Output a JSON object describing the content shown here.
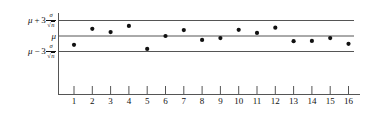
{
  "chart_data": {
    "type": "scatter",
    "title": "",
    "subtitle": "",
    "xlabel": "",
    "ylabel": "",
    "categories": [
      1,
      2,
      3,
      4,
      5,
      6,
      7,
      8,
      9,
      10,
      11,
      12,
      13,
      14,
      15,
      16
    ],
    "xtick_labels": [
      "1",
      "2",
      "3",
      "4",
      "5",
      "6",
      "7",
      "8",
      "9",
      "10",
      "11",
      "12",
      "13",
      "14",
      "15",
      "16"
    ],
    "xlim": [
      0.5,
      16.5
    ],
    "ylim": [
      -4.2,
      4.2
    ],
    "grid": false,
    "legend": "none",
    "series": [
      {
        "name": "sample means",
        "marker": "filled-circle",
        "color": "#111111",
        "x": [
          1,
          2,
          3,
          4,
          5,
          6,
          7,
          8,
          9,
          10,
          11,
          12,
          13,
          14,
          15,
          16
        ],
        "values": [
          -1.7,
          1.4,
          0.75,
          1.95,
          -2.5,
          0.0,
          1.15,
          -0.75,
          -0.4,
          1.2,
          0.6,
          1.6,
          -1.0,
          -0.95,
          -0.4,
          -1.5
        ]
      }
    ],
    "reference_lines": [
      {
        "name": "upper-control-limit",
        "value": 3,
        "label_plain": "mu + 3 sigma / sqrt(n)",
        "label_parts": {
          "mu": "μ",
          "op": "+",
          "coef": "3",
          "num": "σ",
          "den_sym": "√",
          "den_body": "n"
        },
        "color": "#555555"
      },
      {
        "name": "center-line",
        "value": 0,
        "label_plain": "mu",
        "label_parts": {
          "mu": "μ",
          "op": "",
          "coef": "",
          "num": "",
          "den_sym": "",
          "den_body": ""
        },
        "color": "#555555"
      },
      {
        "name": "lower-control-limit",
        "value": -3,
        "label_plain": "mu - 3 sigma / sqrt(n)",
        "label_parts": {
          "mu": "μ",
          "op": "−",
          "coef": "3",
          "num": "σ",
          "den_sym": "√",
          "den_body": "n"
        },
        "color": "#555555"
      }
    ],
    "axis_color": "#555555",
    "point_color": "#111111",
    "background": "#ffffff"
  }
}
